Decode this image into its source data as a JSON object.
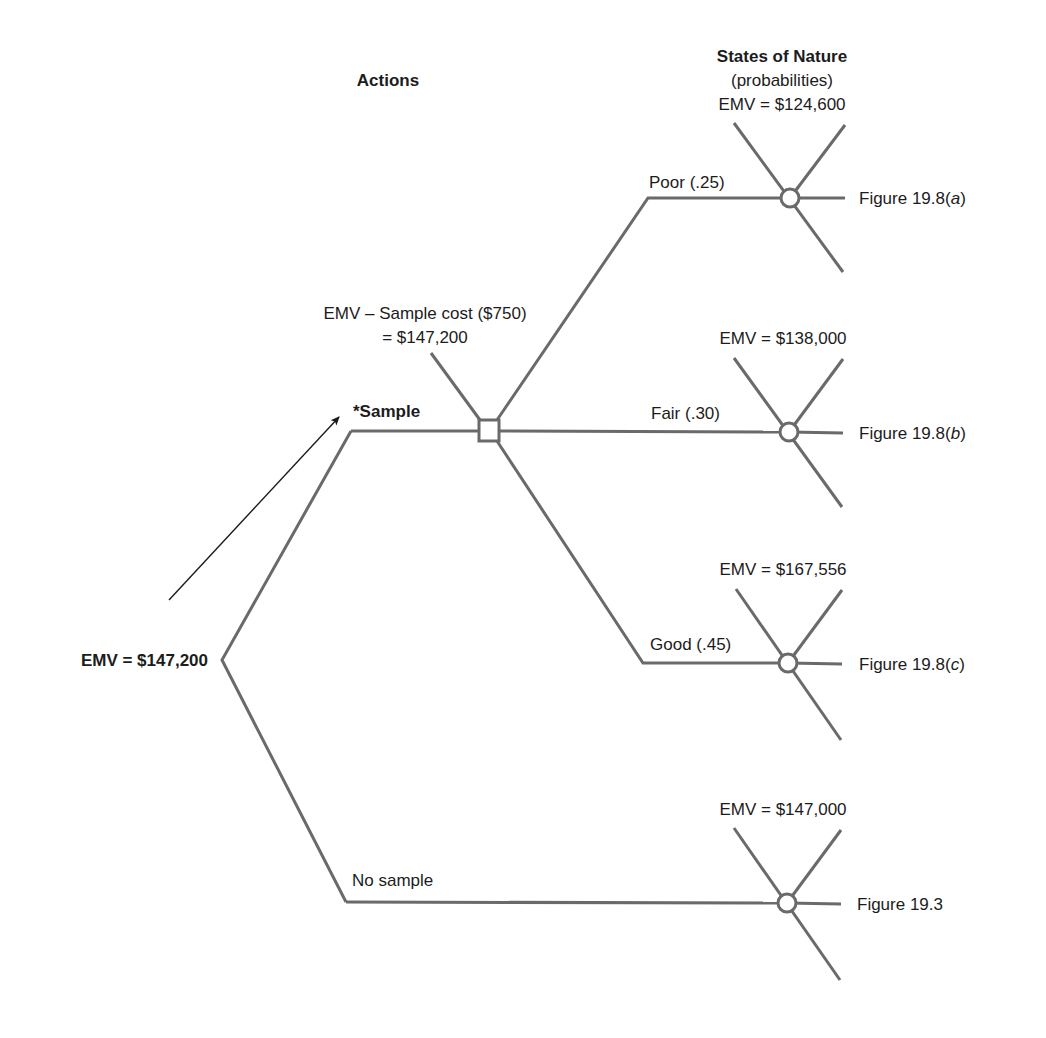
{
  "headers": {
    "actions": "Actions",
    "states_of_nature": "States of Nature",
    "probabilities": "(probabilities)"
  },
  "root": {
    "label": "EMV = $147,200"
  },
  "actions": [
    {
      "label": "*Sample",
      "note_line1": "EMV – Sample cost ($750)",
      "note_line2": "= $147,200",
      "optimal": true
    },
    {
      "label": "No sample",
      "emv": "EMV = $147,000",
      "figure_ref": "Figure 19.3"
    }
  ],
  "sample_outcomes": [
    {
      "label": "Poor (.25)",
      "emv": "EMV = $124,600",
      "figure_prefix": "Figure 19.8(",
      "figure_letter": "a",
      "figure_suffix": ")"
    },
    {
      "label": "Fair (.30)",
      "emv": "EMV = $138,000",
      "figure_prefix": "Figure 19.8(",
      "figure_letter": "b",
      "figure_suffix": ")"
    },
    {
      "label": "Good (.45)",
      "emv": "EMV = $167,556",
      "figure_prefix": "Figure 19.8(",
      "figure_letter": "c",
      "figure_suffix": ")"
    }
  ],
  "colors": {
    "branch": "#6a6a6a",
    "text": "#1c1c1c",
    "background": "#ffffff"
  }
}
